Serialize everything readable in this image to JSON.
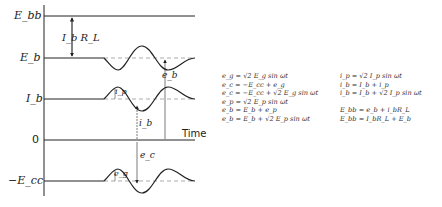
{
  "diagram": {
    "axis_labels": {
      "ebb": "E_bb",
      "eb": "E_b",
      "ib": "I_b",
      "zero": "0",
      "ecc": "−E_cc",
      "time": "Time"
    },
    "annotations": {
      "ibrl": "I_b R_L",
      "eb_lower": "e_b",
      "ip": "i_p",
      "ib_lower": "i_b",
      "ec": "e_c",
      "eg": "e_g"
    },
    "colors": {
      "line": "#222222",
      "dashed": "#888888"
    }
  },
  "equations": {
    "left": [
      "e_g = √2 E_g sin ωt",
      "e_c = −E_cc + e_g",
      "e_c = −E_cc + √2 E_g sin ωt",
      "e_p = √2 E_p sin ωt",
      "e_b = E_b + e_p",
      "e_b = E_b + √2 E_p sin ωt"
    ],
    "right": [
      "i_p = √2 I_p sin ωt",
      "i_b = I_b + i_p",
      "i_b = I_b + √2 I_p sin ωt",
      "",
      "E_bb = e_b + i_bR_L",
      "E_bb = I_bR_L + E_b"
    ]
  }
}
